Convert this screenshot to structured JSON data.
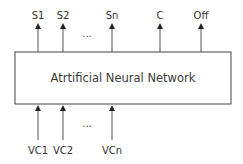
{
  "diagram": {
    "box": {
      "label": "Atrtificial Neural Network",
      "x": 15,
      "y": 52,
      "width": 216,
      "height": 52,
      "stroke": "#444444"
    },
    "outputs": [
      {
        "label": "S1",
        "x": 38
      },
      {
        "label": "S2",
        "x": 63
      },
      {
        "label": "Sn",
        "x": 112
      },
      {
        "label": "C",
        "x": 160
      },
      {
        "label": "Off",
        "x": 201
      }
    ],
    "outputs_ellipsis": "...",
    "inputs": [
      {
        "label": "VC1",
        "x": 38
      },
      {
        "label": "VC2",
        "x": 63
      },
      {
        "label": "VCn",
        "x": 112
      }
    ],
    "inputs_ellipsis": "...",
    "colors": {
      "line": "#444444",
      "text": "#333333",
      "background": "#ffffff"
    }
  }
}
